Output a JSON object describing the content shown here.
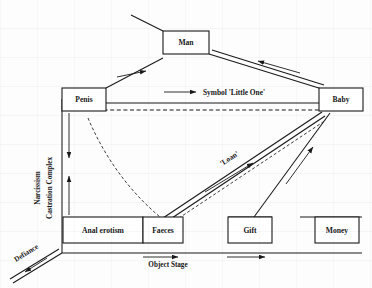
{
  "diagram": {
    "background_color": "#fdfdfd",
    "ink_color": "#1a1a1a",
    "nodes": [
      {
        "id": "man",
        "label": "Man",
        "x": 186,
        "y": 42,
        "w": 46,
        "h": 23
      },
      {
        "id": "penis",
        "label": "Penis",
        "x": 84,
        "y": 99,
        "w": 44,
        "h": 23
      },
      {
        "id": "baby",
        "label": "Baby",
        "x": 341,
        "y": 99,
        "w": 44,
        "h": 23
      },
      {
        "id": "anal",
        "label": "Anal erotism",
        "x": 103,
        "y": 230,
        "w": 79,
        "h": 26
      },
      {
        "id": "faeces",
        "label": "Faeces",
        "x": 163,
        "y": 230,
        "w": 40,
        "h": 26
      },
      {
        "id": "gift",
        "label": "Gift",
        "x": 250,
        "y": 230,
        "w": 44,
        "h": 26
      },
      {
        "id": "money",
        "label": "Money",
        "x": 337,
        "y": 230,
        "w": 44,
        "h": 26
      }
    ],
    "edge_labels": [
      {
        "id": "symbol-little-one",
        "text": "Symbol 'Little One'",
        "x": 203,
        "y": 92,
        "rotation": 0
      },
      {
        "id": "loan",
        "text": "'Loan'",
        "x": 222,
        "y": 166,
        "rotation": -37
      }
    ],
    "axis_labels": [
      {
        "id": "narcissism",
        "text": "Narcissism",
        "x": 40,
        "y": 185,
        "rotation": -90
      },
      {
        "id": "castration-complex",
        "text": "Castration Complex",
        "x": 52,
        "y": 195,
        "rotation": -90
      },
      {
        "id": "defiance",
        "text": "Defiance",
        "x": 14,
        "y": 259,
        "rotation": -34
      },
      {
        "id": "object-stage",
        "text": "Object Stage",
        "x": 168,
        "y": 263,
        "rotation": 0
      }
    ]
  }
}
